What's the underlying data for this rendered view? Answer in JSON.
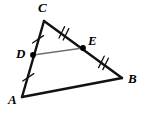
{
  "figure": {
    "type": "geometry-diagram",
    "width": 146,
    "height": 114,
    "background_color": "#ffffff",
    "stroke_color": "#111111",
    "midsegment_color": "#6e6e6e",
    "point_color": "#000000"
  },
  "points": {
    "A": {
      "label": "A",
      "x": 22,
      "y": 97,
      "label_x": 8,
      "label_y": 93
    },
    "B": {
      "label": "B",
      "x": 122,
      "y": 78,
      "label_x": 128,
      "label_y": 72
    },
    "C": {
      "label": "C",
      "x": 44,
      "y": 21,
      "label_x": 38,
      "label_y": 1
    },
    "D": {
      "label": "D",
      "x": 33,
      "y": 55,
      "label_x": 16,
      "label_y": 47
    },
    "E": {
      "label": "E",
      "x": 83,
      "y": 48,
      "label_x": 88,
      "label_y": 34
    }
  },
  "segments": [
    {
      "name": "side-CA",
      "from": "C",
      "to": "A",
      "style": "solid-thick",
      "ticks": 0
    },
    {
      "name": "side-CB",
      "from": "C",
      "to": "B",
      "style": "solid-thick",
      "ticks": 0
    },
    {
      "name": "side-AB",
      "from": "A",
      "to": "B",
      "style": "solid-thick",
      "ticks": 0
    },
    {
      "name": "midsegment-DE",
      "from": "D",
      "to": "E",
      "style": "solid-thin-gray",
      "ticks": 0
    }
  ],
  "congruence_marks": [
    {
      "name": "tick-CD",
      "segment": "C-D",
      "count": 1,
      "x": 38,
      "y": 39
    },
    {
      "name": "tick-DA",
      "segment": "D-A",
      "count": 1,
      "x": 28,
      "y": 77
    },
    {
      "name": "tick-CE",
      "segment": "C-E",
      "count": 2,
      "x": 63,
      "y": 33
    },
    {
      "name": "tick-EB",
      "segment": "E-B",
      "count": 2,
      "x": 103,
      "y": 63
    }
  ],
  "marked_points": [
    {
      "name": "point-D",
      "x": 33,
      "y": 55
    },
    {
      "name": "point-E",
      "x": 83,
      "y": 48
    }
  ]
}
